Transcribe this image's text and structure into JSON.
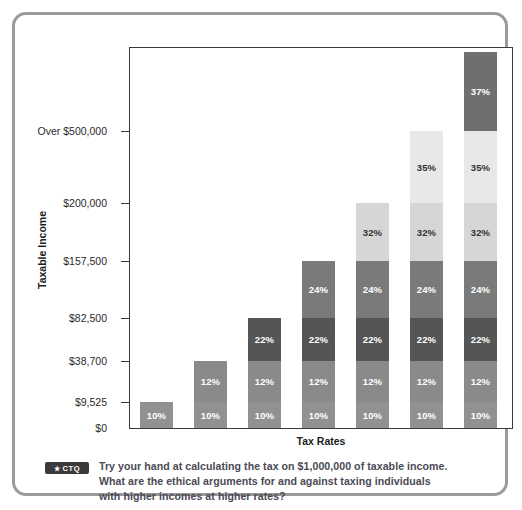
{
  "chart_data": {
    "type": "bar",
    "title": "",
    "subtitle": "",
    "xlabel": "Tax Rates",
    "ylabel": "Taxable Income",
    "grid": false,
    "legend": "none",
    "stacked": true,
    "categories": [
      "Bracket 1",
      "Bracket 2",
      "Bracket 3",
      "Bracket 4",
      "Bracket 5",
      "Bracket 6",
      "Bracket 7"
    ],
    "y_tick_labels": [
      "$0",
      "$9,525",
      "$38,700",
      "$82,500",
      "$157,500",
      "$200,000",
      "Over $500,000"
    ],
    "y_tick_values": [
      0,
      9525,
      38700,
      82500,
      157500,
      200000,
      500000
    ],
    "ylim": [
      0,
      560000
    ],
    "bracket_rates": [
      "10%",
      "12%",
      "22%",
      "24%",
      "32%",
      "35%",
      "37%"
    ],
    "bracket_tops": [
      9525,
      38700,
      82500,
      157500,
      200000,
      500000,
      560000
    ],
    "bars": [
      {
        "top_label": "$9,525",
        "segments": [
          {
            "label": "10%"
          }
        ]
      },
      {
        "top_label": "$38,700",
        "segments": [
          {
            "label": "10%"
          },
          {
            "label": "12%"
          }
        ]
      },
      {
        "top_label": "$82,500",
        "segments": [
          {
            "label": "10%"
          },
          {
            "label": "12%"
          },
          {
            "label": "22%"
          }
        ]
      },
      {
        "top_label": "$157,500",
        "segments": [
          {
            "label": "10%"
          },
          {
            "label": "12%"
          },
          {
            "label": "22%"
          },
          {
            "label": "24%"
          }
        ]
      },
      {
        "top_label": "$200,000",
        "segments": [
          {
            "label": "10%"
          },
          {
            "label": "12%"
          },
          {
            "label": "22%"
          },
          {
            "label": "24%"
          },
          {
            "label": "32%"
          }
        ]
      },
      {
        "top_label": "Over $500,000",
        "segments": [
          {
            "label": "10%"
          },
          {
            "label": "12%"
          },
          {
            "label": "22%"
          },
          {
            "label": "24%"
          },
          {
            "label": "32%"
          },
          {
            "label": "35%"
          }
        ]
      },
      {
        "top_label": "",
        "segments": [
          {
            "label": "10%"
          },
          {
            "label": "12%"
          },
          {
            "label": "22%"
          },
          {
            "label": "24%"
          },
          {
            "label": "32%"
          },
          {
            "label": "35%"
          },
          {
            "label": "37%"
          }
        ]
      }
    ],
    "segment_colors": [
      "#919191",
      "#8a8a8a",
      "#555555",
      "#7a7a7a",
      "#d6d6d6",
      "#e8e8e8",
      "#6f6f6f"
    ],
    "segment_text_colors": [
      "#ffffff",
      "#ffffff",
      "#ffffff",
      "#ffffff",
      "#333333",
      "#333333",
      "#ffffff"
    ]
  },
  "axis": {
    "y_title": "Taxable Income",
    "x_title": "Tax Rates"
  },
  "caption": {
    "badge_star": "★",
    "badge_label": "CTQ",
    "line1": "Try your hand at calculating the tax on $1,000,000 of taxable income.",
    "line2": "What are the ethical arguments for and against taxing individuals",
    "line3": "with higher incomes at higher rates?"
  },
  "colors": {
    "card_border": "#9a9a9a",
    "plot_border": "#3a3a3a",
    "tick_text": "#2a2a2a",
    "axis_title": "#1c1c1c",
    "caption_text": "#4a4a55",
    "badge_bg": "#3a3a3a"
  }
}
